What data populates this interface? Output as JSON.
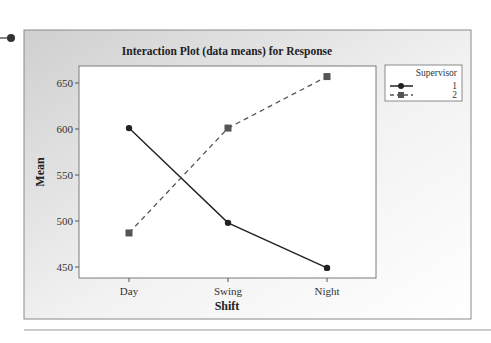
{
  "chart_data": {
    "type": "line",
    "title": "Interaction Plot (data means) for Response",
    "xlabel": "Shift",
    "ylabel": "Mean",
    "categories": [
      "Day",
      "Swing",
      "Night"
    ],
    "ylim": [
      438,
      668
    ],
    "yticks": [
      450,
      500,
      550,
      600,
      650
    ],
    "ytick_labels": [
      "450",
      "500",
      "550",
      "600",
      "650"
    ],
    "grid": false,
    "legend": {
      "title": "Supervisor",
      "placement": "right",
      "entries": [
        "1",
        "2"
      ]
    },
    "series": [
      {
        "name": "1",
        "style": "solid",
        "marker": "circle",
        "color": "#222222",
        "values": [
          601,
          498,
          449
        ]
      },
      {
        "name": "2",
        "style": "dashed",
        "marker": "square",
        "color": "#555555",
        "values": [
          487,
          601,
          657
        ]
      }
    ]
  },
  "colors": {
    "panel_gray": "#d9d9d9",
    "plot_bg": "#ffffff",
    "frame": "#7a7a7a"
  }
}
